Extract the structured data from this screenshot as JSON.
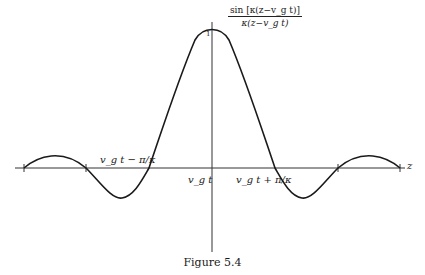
{
  "figure": {
    "caption": "Figure 5.4",
    "y_label_numerator": "sin [κ(z−v_g t)]",
    "y_label_denominator": "κ(z−v_g t)",
    "y_tick": "1",
    "x_axis_label": "z",
    "labels": {
      "left_zero": "v_g t − π/κ",
      "center": "v_g t",
      "right_zero": "v_g t + π/κ"
    }
  }
}
